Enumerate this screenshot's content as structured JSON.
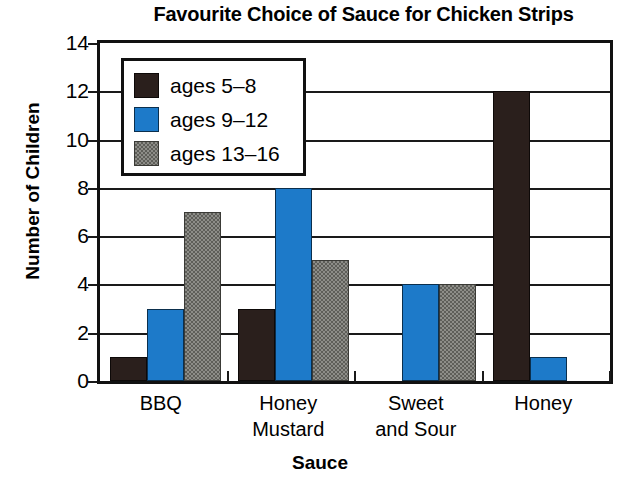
{
  "chart_data": {
    "type": "bar",
    "title": "Favourite Choice of Sauce for Chicken Strips",
    "xlabel": "Sauce",
    "ylabel": "Number of Children",
    "categories": [
      "BBQ",
      "Honey\nMustard",
      "Sweet\nand Sour",
      "Honey"
    ],
    "series": [
      {
        "name": "ages 5–8",
        "color": "#2a1f1c",
        "values": [
          1,
          3,
          0,
          12
        ]
      },
      {
        "name": "ages 9–12",
        "color": "#1d7ac9",
        "values": [
          3,
          8,
          4,
          1
        ]
      },
      {
        "name": "ages 13–16",
        "color": "#8d8d88",
        "values": [
          7,
          5,
          4,
          0
        ]
      }
    ],
    "ylim": [
      0,
      14
    ],
    "yticks": [
      0,
      2,
      4,
      6,
      8,
      10,
      12,
      14
    ],
    "ytick_labels": [
      "0",
      "2",
      "4",
      "6",
      "8",
      "10",
      "12",
      "14"
    ],
    "grid": true,
    "grid_axis": "y",
    "legend_position": "upper left"
  },
  "legend": {
    "entries": [
      {
        "label": "ages 5–8"
      },
      {
        "label": "ages 9–12"
      },
      {
        "label": "ages 13–16"
      }
    ]
  }
}
